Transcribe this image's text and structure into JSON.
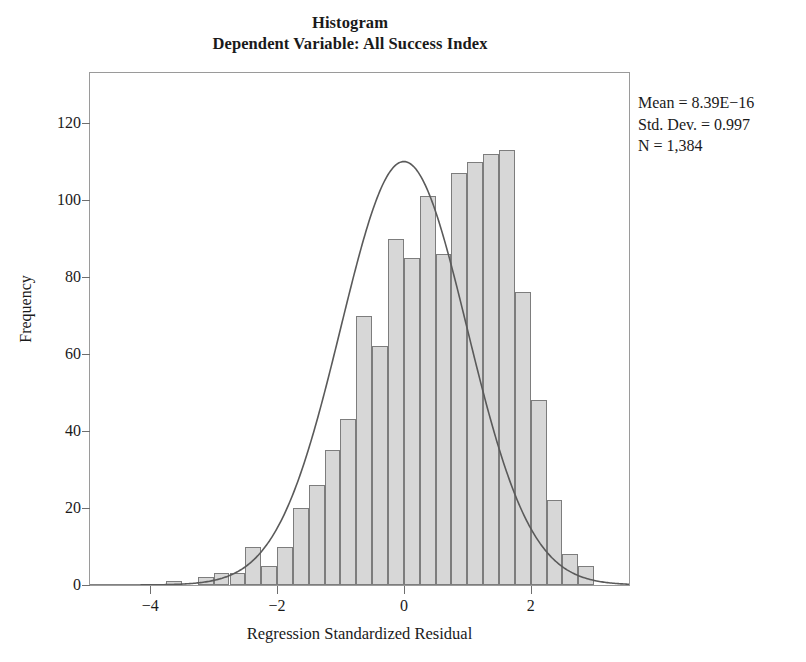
{
  "chart_data": {
    "type": "bar",
    "title": "Histogram",
    "subtitle": "Dependent Variable: All Success Index",
    "xlabel": "Regression Standardized Residual",
    "ylabel": "Frequency",
    "xlim": [
      -4.95,
      3.55
    ],
    "ylim": [
      0,
      133
    ],
    "grid": false,
    "legend": null,
    "bin_width": 0.25,
    "bar_fill": "#d7d7d7",
    "bar_stroke": "#7d7d7d",
    "curve_color": "#5a5a5a",
    "xticks": [
      -4,
      -2,
      0,
      2
    ],
    "xtick_labels": [
      "−4",
      "−2",
      "0",
      "2"
    ],
    "yticks": [
      0,
      20,
      40,
      60,
      80,
      100,
      120
    ],
    "ytick_labels": [
      "0",
      "20",
      "40",
      "60",
      "80",
      "100",
      "120"
    ],
    "bin_centers": [
      -3.625,
      -3.375,
      -3.125,
      -2.875,
      -2.625,
      -2.375,
      -2.125,
      -1.875,
      -1.625,
      -1.375,
      -1.125,
      -0.875,
      -0.625,
      -0.375,
      -0.125,
      0.125,
      0.375,
      0.625,
      0.875,
      1.125,
      1.375,
      1.625,
      1.875,
      2.125,
      2.375,
      2.625,
      2.875
    ],
    "values": [
      1,
      0,
      2,
      3,
      3,
      10,
      5,
      10,
      20,
      26,
      35,
      43,
      70,
      62,
      90,
      85,
      101,
      86,
      107,
      110,
      112,
      113,
      76,
      48,
      22,
      8,
      5
    ],
    "curve_overlay": {
      "type": "normal",
      "mean": 0.0,
      "std_dev": 0.997,
      "peak_frequency": 110
    },
    "annotations": {
      "mean": "Mean = 8.39E−16",
      "std_dev": "Std. Dev. = 0.997",
      "n": "N = 1,384"
    }
  }
}
